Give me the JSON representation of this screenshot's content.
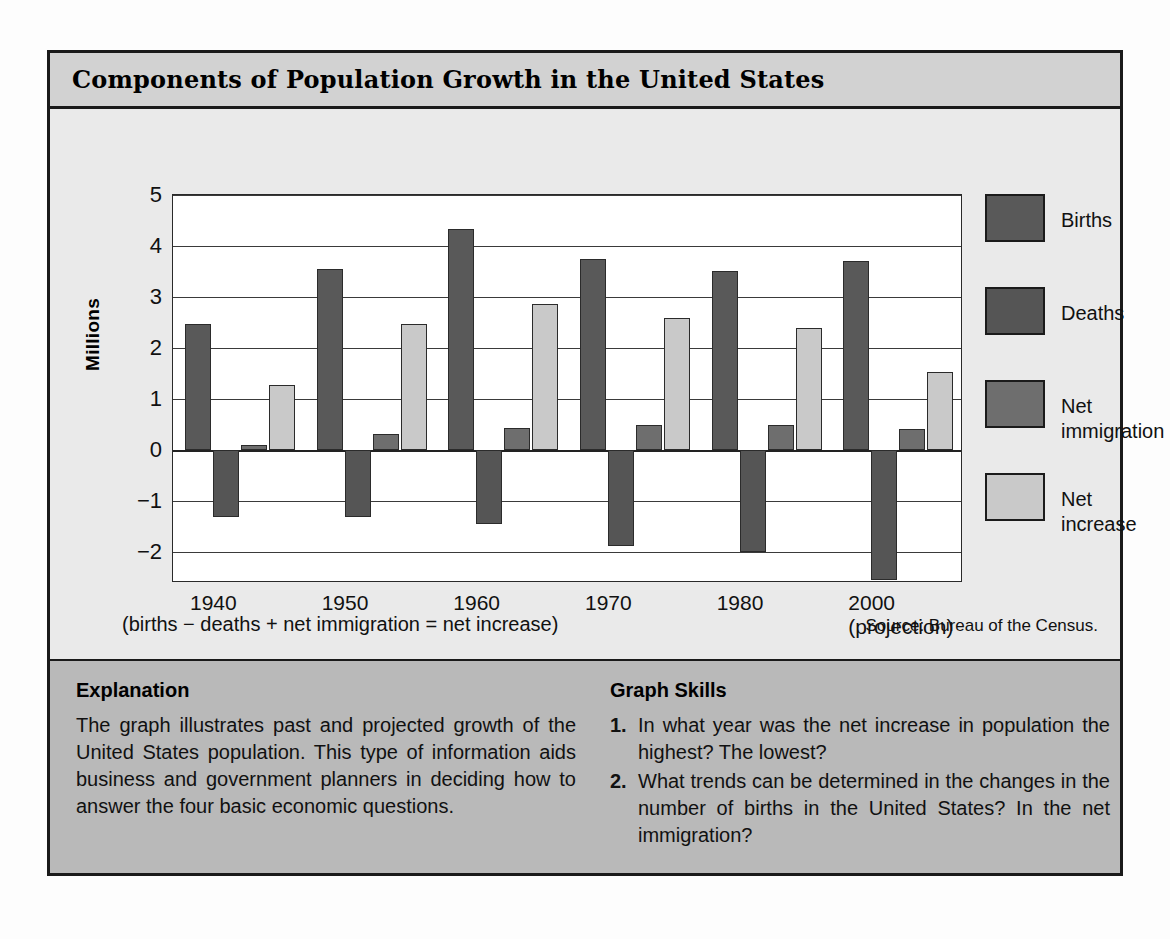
{
  "title": "Components of Population Growth in the United States",
  "axis": {
    "ylabel": "Millions",
    "yticks": [
      "5",
      "4",
      "3",
      "2",
      "1",
      "0",
      "−1",
      "−2"
    ]
  },
  "legend": [
    {
      "label": "Births",
      "color": "#595959"
    },
    {
      "label": "Deaths",
      "color": "#555555"
    },
    {
      "label": "Net\nimmigration",
      "color": "#6e6e6e"
    },
    {
      "label": "Net\nincrease",
      "color": "#c9c9c9"
    }
  ],
  "formula_note": "(births − deaths + net immigration = net increase)",
  "source_note": "Source: Bureau of the Census.",
  "explanation": {
    "heading": "Explanation",
    "body": "The graph illustrates past and projected growth of the United States population. This type of information aids business and government planners in deciding how to answer the four basic economic questions."
  },
  "graph_skills": {
    "heading": "Graph Skills",
    "questions": [
      {
        "num": "1.",
        "text": "In what year was the net increase in population the highest? The lowest?"
      },
      {
        "num": "2.",
        "text": "What trends can be determined in the changes in the number of births in the United States? In the net immigration?"
      }
    ]
  },
  "chart_data": {
    "type": "bar",
    "title": "Components of Population Growth in the United States",
    "xlabel": "",
    "ylabel": "Millions",
    "ylim": [
      -2.6,
      5
    ],
    "yticks": [
      5,
      4,
      3,
      2,
      1,
      0,
      -1,
      -2
    ],
    "grid": true,
    "legend_position": "right",
    "categories": [
      "1940",
      "1950",
      "1960",
      "1970",
      "1980",
      "2000 (projection)"
    ],
    "category_sub": [
      "",
      "",
      "",
      "",
      "",
      "(projection)"
    ],
    "series": [
      {
        "name": "Births",
        "color": "#595959",
        "values": [
          2.47,
          3.55,
          4.33,
          3.75,
          3.52,
          3.7
        ]
      },
      {
        "name": "Deaths",
        "color": "#555555",
        "values": [
          -1.3,
          -1.31,
          -1.44,
          -1.88,
          -2.0,
          -2.55
        ]
      },
      {
        "name": "Net immigration",
        "color": "#6e6e6e",
        "values": [
          0.1,
          0.32,
          0.43,
          0.5,
          0.5,
          0.42
        ]
      },
      {
        "name": "Net increase",
        "color": "#c9c9c9",
        "values": [
          1.27,
          2.47,
          2.87,
          2.6,
          2.4,
          1.53
        ]
      }
    ],
    "annotations": [
      "(births − deaths + net immigration = net increase)",
      "Source: Bureau of the Census."
    ]
  }
}
